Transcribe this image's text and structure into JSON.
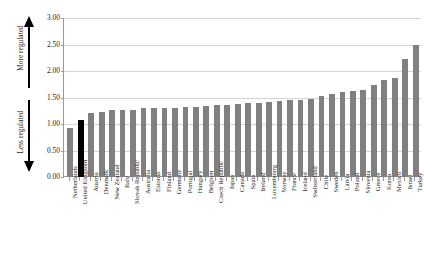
{
  "chart_data": {
    "type": "bar",
    "title": "",
    "subtitle": "",
    "xlabel": "",
    "ylabel": "",
    "ylim": [
      0.0,
      3.0
    ],
    "ytick_step": 0.5,
    "grid": true,
    "legend": false,
    "highlight_category": "United Kingdom",
    "highlight_color": "#000000",
    "bar_color": "#808080",
    "categories": [
      "Netherlands",
      "United Kingdom",
      "Austria",
      "Denmark",
      "New Zealand",
      "Italy",
      "Slovak Republic",
      "Australia",
      "Estonia",
      "Finland",
      "Germany",
      "Portugal",
      "Hungary",
      "Belgium",
      "Czech Republic",
      "Japan",
      "Canada",
      "Spain",
      "Ireland",
      "Luxembourg",
      "Norway",
      "France",
      "Iceland",
      "Switzerland",
      "Chile",
      "Sweden",
      "Latvia",
      "Poland",
      "Slovenia",
      "Greece",
      "Korea",
      "Mexico",
      "Israel",
      "Turkey"
    ],
    "values": [
      0.92,
      1.08,
      1.2,
      1.23,
      1.26,
      1.27,
      1.27,
      1.3,
      1.3,
      1.3,
      1.31,
      1.32,
      1.33,
      1.34,
      1.35,
      1.36,
      1.37,
      1.4,
      1.4,
      1.42,
      1.44,
      1.45,
      1.46,
      1.48,
      1.52,
      1.57,
      1.6,
      1.62,
      1.65,
      1.73,
      1.83,
      1.86,
      2.22,
      2.5
    ],
    "ytick_labels": [
      "3.00",
      "2.50",
      "2.00",
      "1.50",
      "1.00",
      "0.50",
      "0.00"
    ],
    "annotations": [
      {
        "name": "more-regulated",
        "text": "More regulated",
        "direction": "up"
      },
      {
        "name": "less-regulated",
        "text": "Less regulated",
        "direction": "down"
      }
    ]
  }
}
